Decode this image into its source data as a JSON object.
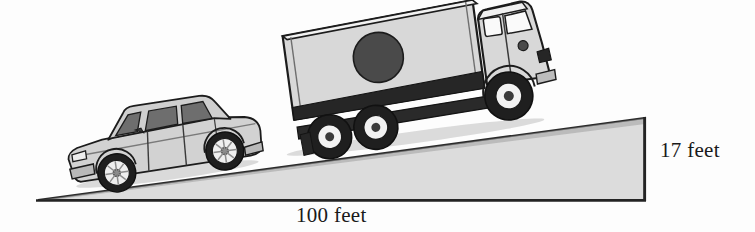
{
  "figure": {
    "canvas": {
      "width": 755,
      "height": 232,
      "background": "#fdfdfd"
    }
  },
  "labels": {
    "rise": "17 feet",
    "run": "100 feet"
  },
  "measurements": {
    "rise_value": 17,
    "rise_unit": "feet",
    "run_value": 100,
    "run_unit": "feet"
  },
  "ramp": {
    "name": "incline-ramp",
    "fill": "#dcdcdc",
    "stroke": "#2b2b2b",
    "apex_left": [
      38,
      200
    ],
    "corner_bottom_right": [
      645,
      200
    ],
    "corner_top_right": [
      645,
      118
    ]
  },
  "vehicles": [
    {
      "name": "sedan-car",
      "type": "car",
      "body_fill": "#d2d2d2",
      "glass_fill": "#6e6e6e",
      "outline": "#1c1c1c",
      "facing": "downhill-left"
    },
    {
      "name": "box-truck",
      "type": "truck",
      "body_fill": "#d8d8d8",
      "skirt_fill": "#262626",
      "logo_fill": "#4a4a4a",
      "outline": "#1c1c1c",
      "facing": "uphill-right"
    }
  ],
  "colors": {
    "ink": "#1a1a1a",
    "ramp_fill": "#dcdcdc",
    "tire": "#1f1f1f",
    "rim": "#f2f2f2"
  }
}
